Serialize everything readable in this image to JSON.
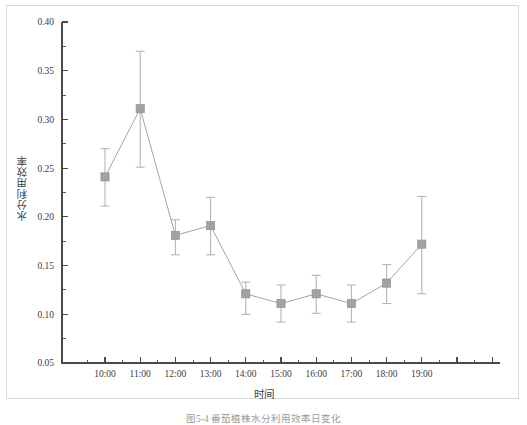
{
  "figure": {
    "caption": "图5-4  番茄植株水分利用效率日变化",
    "y_axis_title": "水分利用效率",
    "x_axis_title": "时间"
  },
  "chart_data": {
    "type": "line",
    "title": "",
    "subtitle": "",
    "xlabel": "时间",
    "ylabel": "水分利用效率",
    "categories": [
      "10:00",
      "11:00",
      "12:00",
      "13:00",
      "14:00",
      "15:00",
      "16:00",
      "17:00",
      "18:00",
      "19:00"
    ],
    "values": [
      0.241,
      0.311,
      0.181,
      0.191,
      0.121,
      0.111,
      0.121,
      0.111,
      0.132,
      0.172
    ],
    "error_upper": [
      0.27,
      0.37,
      0.197,
      0.22,
      0.133,
      0.13,
      0.14,
      0.13,
      0.151,
      0.221
    ],
    "error_lower": [
      0.211,
      0.251,
      0.161,
      0.161,
      0.1,
      0.092,
      0.101,
      0.092,
      0.111,
      0.121
    ],
    "ylim": [
      0.05,
      0.4
    ],
    "yticks": [
      0.05,
      0.1,
      0.15,
      0.2,
      0.25,
      0.3,
      0.35,
      0.4
    ],
    "ytick_labels": [
      "0.05",
      "0.10",
      "0.15",
      "0.20",
      "0.25",
      "0.30",
      "0.35",
      "0.40"
    ],
    "y_minor_ticks_between": 1,
    "grid": false,
    "legend": false,
    "legend_position": "none",
    "marker": "square",
    "marker_color": "#a2a2a2",
    "line_color": "#9a9a9a",
    "errorbar_color": "#a6a6a6",
    "axis_color": "#4a4a4a"
  },
  "colors": {
    "background": "#ffffff",
    "frame": "#d9d9d9",
    "text": "#3c3c3c",
    "caption": "#9a9a9a"
  }
}
